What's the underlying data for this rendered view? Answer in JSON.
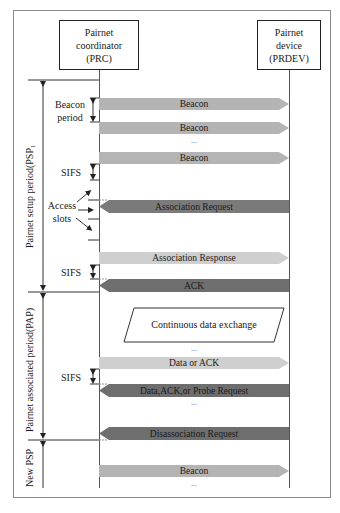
{
  "entities": {
    "coordinator": {
      "line1": "Pairnet",
      "line2": "coordinator",
      "line3": "(PRC)"
    },
    "device": {
      "line1": "Pairnet",
      "line2": "device",
      "line3": "(PRDEV)"
    }
  },
  "periods": {
    "psp": "Pairnet setup period(PSP₁",
    "pap": "Pairnet associated period(PAP)",
    "new_psp": "New PSP"
  },
  "side_labels": {
    "beacon_period_1": "Beacon",
    "beacon_period_2": "period",
    "sifs_1": "SIFS",
    "access_slots_1": "Access",
    "access_slots_2": "slots",
    "sifs_2": "SIFS",
    "sifs_3": "SIFS"
  },
  "messages": [
    {
      "label": "Beacon",
      "direction": "right",
      "color": "#b4b4b4"
    },
    {
      "label": "Beacon",
      "direction": "right",
      "color": "#b4b4b4"
    },
    {
      "label": "...",
      "type": "ellipsis"
    },
    {
      "label": "Beacon",
      "direction": "right",
      "color": "#b4b4b4"
    },
    {
      "label": "Association Request",
      "direction": "left",
      "color": "#7a7a7a"
    },
    {
      "label": "Association Response",
      "direction": "right",
      "color": "#cfcfcf"
    },
    {
      "label": "ACK",
      "direction": "left",
      "color": "#6e6e6e"
    },
    {
      "label": "Continuous data exchange",
      "type": "parallelogram"
    },
    {
      "label": "...",
      "type": "ellipsis"
    },
    {
      "label": "Data or ACK",
      "direction": "right",
      "color": "#cfcfcf"
    },
    {
      "label": "Data,ACK,or Probe Request",
      "direction": "left",
      "color": "#6e6e6e"
    },
    {
      "label": "...",
      "type": "ellipsis"
    },
    {
      "label": "Disassociation Request",
      "direction": "left",
      "color": "#6e6e6e"
    },
    {
      "label": "Beacon",
      "direction": "right",
      "color": "#b4b4b4"
    },
    {
      "label": "...",
      "type": "ellipsis"
    }
  ]
}
